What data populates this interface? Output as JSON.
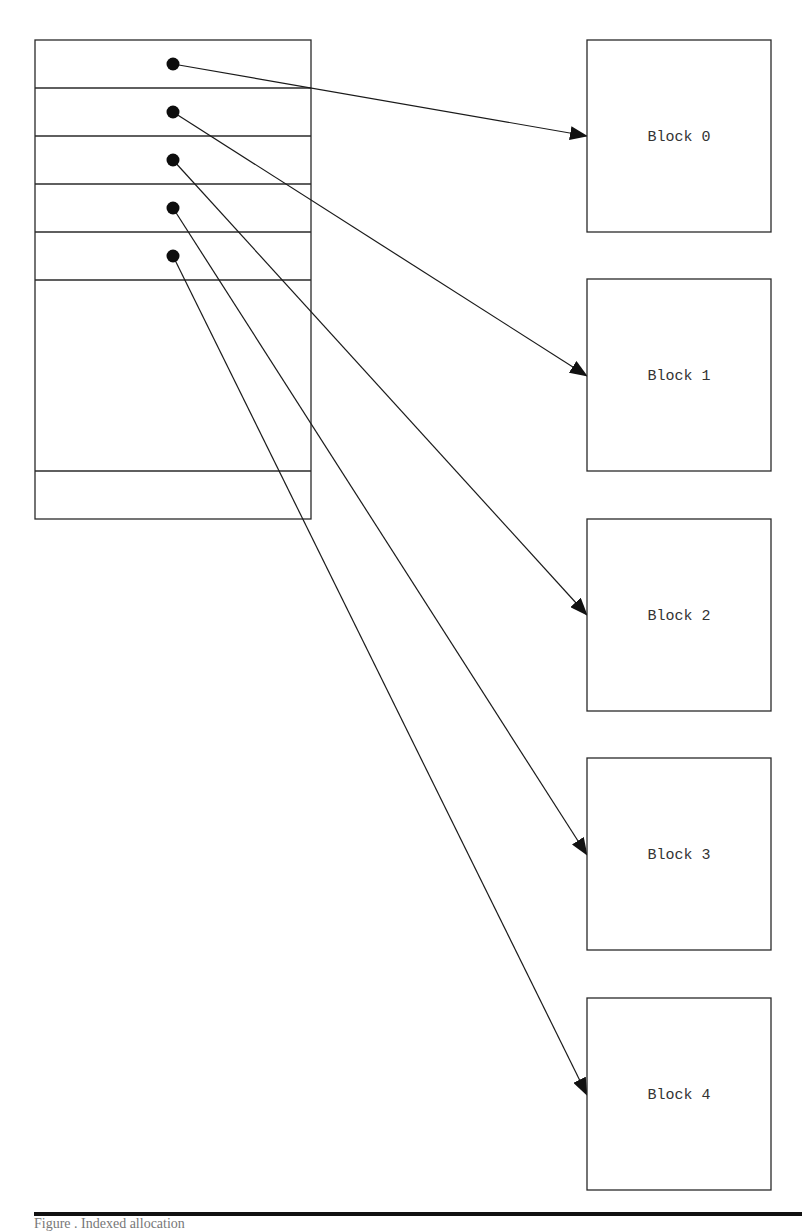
{
  "diagram": {
    "index_block": {
      "x": 35,
      "y": 40,
      "width": 276,
      "height": 479,
      "row_lines_y": [
        88,
        136,
        184,
        232,
        280,
        471
      ],
      "pointer_slots": [
        {
          "dot": [
            173,
            64
          ],
          "target": "Block 0"
        },
        {
          "dot": [
            173,
            112
          ],
          "target": "Block 1"
        },
        {
          "dot": [
            173,
            160
          ],
          "target": "Block 2"
        },
        {
          "dot": [
            173,
            208
          ],
          "target": "Block 3"
        },
        {
          "dot": [
            173,
            256
          ],
          "target": "Block 4"
        }
      ]
    },
    "blocks": [
      {
        "label": "Block 0",
        "x": 587,
        "y": 40,
        "width": 184,
        "height": 192,
        "arrow_tip": [
          587,
          136
        ]
      },
      {
        "label": "Block 1",
        "x": 587,
        "y": 279,
        "width": 184,
        "height": 192,
        "arrow_tip": [
          587,
          376
        ]
      },
      {
        "label": "Block 2",
        "x": 587,
        "y": 519,
        "width": 184,
        "height": 192,
        "arrow_tip": [
          587,
          615
        ]
      },
      {
        "label": "Block 3",
        "x": 587,
        "y": 758,
        "width": 184,
        "height": 192,
        "arrow_tip": [
          587,
          855
        ]
      },
      {
        "label": "Block 4",
        "x": 587,
        "y": 998,
        "width": 184,
        "height": 192,
        "arrow_tip": [
          587,
          1095
        ]
      }
    ],
    "footer_rule": {
      "x1": 34,
      "x2": 802,
      "y": 1214
    },
    "caption": "Figure . Indexed allocation",
    "colors": {
      "stroke": "#2a2a2a",
      "fill": "#ffffff",
      "text": "#333333"
    }
  }
}
